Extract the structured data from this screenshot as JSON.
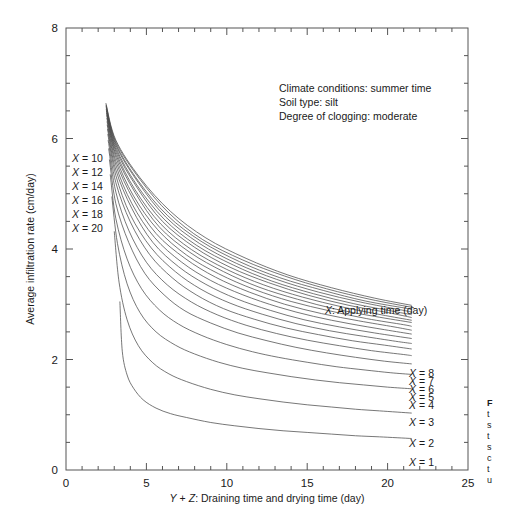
{
  "chart_data": {
    "type": "line",
    "title": "",
    "xlabel": "Y + Z: Draining time and drying time (day)",
    "ylabel": "Average infiltration rate (cm/day)",
    "xlim": [
      0,
      25
    ],
    "ylim": [
      0,
      8
    ],
    "xticks": [
      0,
      5,
      10,
      15,
      20,
      25
    ],
    "yticks": [
      0,
      2,
      4,
      6,
      8
    ],
    "xtick_labels": [
      "0",
      "5",
      "10",
      "15",
      "20",
      "25"
    ],
    "ytick_labels": [
      "0",
      "2",
      "4",
      "6",
      "8"
    ],
    "x_minor_step": 1,
    "y_minor_step": 0.5,
    "grid": false,
    "legend_position": "inside-right",
    "legend_note": "X: Applying time (day)",
    "annotations": [
      "Climate conditions: summer time",
      "Soil type: silt",
      "Degree of clogging: moderate"
    ],
    "series_variable": "X",
    "series": [
      {
        "name": "X = 1",
        "x": [
          3.35,
          3.5,
          3.8,
          4.2,
          4.8,
          5.6,
          6.5,
          7.5,
          9,
          10.5,
          12,
          13.5,
          15,
          16.5,
          18,
          19.5,
          21.5
        ],
        "values": [
          3.05,
          2.15,
          1.72,
          1.48,
          1.27,
          1.12,
          1.02,
          0.95,
          0.86,
          0.8,
          0.75,
          0.71,
          0.68,
          0.65,
          0.62,
          0.6,
          0.57
        ]
      },
      {
        "name": "X = 2",
        "x": [
          3.0,
          3.3,
          3.8,
          4.5,
          5.4,
          6.4,
          7.5,
          9,
          10.5,
          12,
          13.5,
          15,
          16.5,
          18,
          19.5,
          21.5
        ],
        "values": [
          4.32,
          3.4,
          2.72,
          2.25,
          1.94,
          1.74,
          1.6,
          1.46,
          1.36,
          1.29,
          1.23,
          1.18,
          1.14,
          1.1,
          1.07,
          1.03
        ]
      },
      {
        "name": "X = 3",
        "x": [
          2.85,
          3.2,
          3.8,
          4.6,
          5.6,
          6.8,
          8,
          9.5,
          11,
          12.5,
          14,
          15.5,
          17,
          18.5,
          20,
          21.5
        ],
        "values": [
          4.95,
          4.1,
          3.37,
          2.85,
          2.5,
          2.26,
          2.1,
          1.95,
          1.84,
          1.76,
          1.69,
          1.63,
          1.58,
          1.54,
          1.5,
          1.47
        ]
      },
      {
        "name": "X = 4",
        "x": [
          2.75,
          3.1,
          3.8,
          4.7,
          5.8,
          7,
          8.4,
          10,
          11.6,
          13.2,
          15,
          16.8,
          18.6,
          20.2,
          21.5
        ],
        "values": [
          5.35,
          4.55,
          3.82,
          3.28,
          2.9,
          2.64,
          2.44,
          2.27,
          2.14,
          2.04,
          1.95,
          1.87,
          1.81,
          1.76,
          1.73
        ]
      },
      {
        "name": "X = 5",
        "x": [
          2.7,
          3.1,
          3.9,
          4.9,
          6.1,
          7.4,
          9,
          10.7,
          12.5,
          14.3,
          16.2,
          18,
          19.8,
          21.5
        ],
        "values": [
          5.62,
          4.82,
          4.12,
          3.56,
          3.17,
          2.88,
          2.66,
          2.48,
          2.34,
          2.22,
          2.12,
          2.04,
          1.97,
          1.92
        ]
      },
      {
        "name": "X = 6",
        "x": [
          2.65,
          3.1,
          3.9,
          5,
          6.3,
          7.8,
          9.4,
          11.2,
          13.1,
          15,
          17,
          19,
          21,
          21.5
        ],
        "values": [
          5.82,
          5.03,
          4.34,
          3.76,
          3.35,
          3.04,
          2.81,
          2.62,
          2.47,
          2.35,
          2.25,
          2.16,
          2.09,
          2.07
        ]
      },
      {
        "name": "X = 7",
        "x": [
          2.62,
          3.1,
          4,
          5.2,
          6.6,
          8.1,
          9.8,
          11.7,
          13.7,
          15.7,
          17.8,
          19.8,
          21.5
        ],
        "values": [
          5.97,
          5.2,
          4.49,
          3.9,
          3.48,
          3.17,
          2.92,
          2.73,
          2.57,
          2.45,
          2.34,
          2.26,
          2.19
        ]
      },
      {
        "name": "X = 8",
        "x": [
          2.6,
          3.1,
          4,
          5.3,
          6.8,
          8.4,
          10.2,
          12.2,
          14.3,
          16.4,
          18.5,
          20.5,
          21.5
        ],
        "values": [
          6.08,
          5.33,
          4.62,
          4.02,
          3.59,
          3.27,
          3.02,
          2.82,
          2.65,
          2.52,
          2.42,
          2.33,
          2.29
        ]
      },
      {
        "name": "X = 9",
        "x": [
          2.58,
          3.1,
          4.1,
          5.4,
          7,
          8.7,
          10.6,
          12.7,
          14.8,
          17,
          19.2,
          21.5
        ],
        "values": [
          6.17,
          5.43,
          4.73,
          4.12,
          3.68,
          3.36,
          3.1,
          2.89,
          2.72,
          2.59,
          2.48,
          2.38
        ]
      },
      {
        "name": "X = 10",
        "x": [
          2.56,
          3.1,
          4.1,
          5.5,
          7.2,
          9,
          11,
          13.2,
          15.4,
          17.6,
          19.8,
          21.5
        ],
        "values": [
          6.25,
          5.52,
          4.82,
          4.21,
          3.76,
          3.43,
          3.17,
          2.95,
          2.78,
          2.65,
          2.54,
          2.46
        ]
      },
      {
        "name": "X = 11",
        "x": [
          2.55,
          3.1,
          4.2,
          5.6,
          7.4,
          9.3,
          11.4,
          13.6,
          15.9,
          18.2,
          20.4,
          21.5
        ],
        "values": [
          6.31,
          5.59,
          4.89,
          4.28,
          3.83,
          3.49,
          3.22,
          3.0,
          2.83,
          2.7,
          2.59,
          2.53
        ]
      },
      {
        "name": "X = 12",
        "x": [
          2.54,
          3.1,
          4.2,
          5.7,
          7.5,
          9.5,
          11.7,
          14,
          16.4,
          18.7,
          21,
          21.5
        ],
        "values": [
          6.37,
          5.66,
          4.96,
          4.35,
          3.89,
          3.55,
          3.27,
          3.05,
          2.88,
          2.74,
          2.63,
          2.6
        ]
      },
      {
        "name": "X = 13",
        "x": [
          2.53,
          3.1,
          4.3,
          5.8,
          7.7,
          9.8,
          12,
          14.4,
          16.8,
          19.2,
          21.5
        ],
        "values": [
          6.42,
          5.71,
          5.02,
          4.4,
          3.94,
          3.59,
          3.31,
          3.09,
          2.91,
          2.78,
          2.67
        ]
      },
      {
        "name": "X = 14",
        "x": [
          2.52,
          3.1,
          4.3,
          5.9,
          7.8,
          10,
          12.3,
          14.7,
          17.2,
          19.6,
          21.5
        ],
        "values": [
          6.46,
          5.76,
          5.07,
          4.45,
          3.99,
          3.63,
          3.35,
          3.13,
          2.95,
          2.81,
          2.71
        ]
      },
      {
        "name": "X = 15",
        "x": [
          2.51,
          3.1,
          4.4,
          6,
          8,
          10.2,
          12.6,
          15.1,
          17.6,
          20,
          21.5
        ],
        "values": [
          6.5,
          5.8,
          5.12,
          4.5,
          4.03,
          3.67,
          3.39,
          3.16,
          2.98,
          2.85,
          2.76
        ]
      },
      {
        "name": "X = 16",
        "x": [
          2.5,
          3.1,
          4.4,
          6.1,
          8.1,
          10.4,
          12.8,
          15.4,
          17.9,
          20.4,
          21.5
        ],
        "values": [
          6.53,
          5.84,
          5.16,
          4.54,
          4.07,
          3.71,
          3.42,
          3.19,
          3.01,
          2.87,
          2.81
        ]
      },
      {
        "name": "X = 17",
        "x": [
          2.5,
          3.1,
          4.5,
          6.2,
          8.3,
          10.6,
          13.1,
          15.7,
          18.3,
          20.8,
          21.5
        ],
        "values": [
          6.56,
          5.88,
          5.2,
          4.58,
          4.1,
          3.74,
          3.45,
          3.22,
          3.04,
          2.9,
          2.86
        ]
      },
      {
        "name": "X = 18",
        "x": [
          2.49,
          3.1,
          4.5,
          6.3,
          8.4,
          10.8,
          13.3,
          16,
          18.6,
          21.1,
          21.5
        ],
        "values": [
          6.59,
          5.91,
          5.23,
          4.61,
          4.14,
          3.77,
          3.48,
          3.25,
          3.06,
          2.93,
          2.91
        ]
      },
      {
        "name": "X = 19",
        "x": [
          2.49,
          3.1,
          4.6,
          6.4,
          8.5,
          11,
          13.6,
          16.2,
          18.9,
          21.4,
          21.5
        ],
        "values": [
          6.61,
          5.94,
          5.26,
          4.65,
          4.17,
          3.8,
          3.51,
          3.28,
          3.09,
          2.95,
          2.95
        ]
      },
      {
        "name": "X = 20",
        "x": [
          2.48,
          3.1,
          4.6,
          6.5,
          8.7,
          11.2,
          13.8,
          16.5,
          19.2,
          21.5
        ],
        "values": [
          6.64,
          5.97,
          5.29,
          4.68,
          4.2,
          3.83,
          3.53,
          3.3,
          3.11,
          2.98
        ]
      }
    ],
    "left_labels": [
      {
        "text": "X = 10",
        "value": 10
      },
      {
        "text": "X = 12",
        "value": 12
      },
      {
        "text": "X = 14",
        "value": 14
      },
      {
        "text": "X = 16",
        "value": 16
      },
      {
        "text": "X = 18",
        "value": 18
      },
      {
        "text": "X = 20",
        "value": 20
      }
    ],
    "right_labels": [
      {
        "text": "X = 8",
        "value": 8
      },
      {
        "text": "X = 7",
        "value": 7
      },
      {
        "text": "X = 6",
        "value": 6
      },
      {
        "text": "X = 5",
        "value": 5
      },
      {
        "text": "X = 4",
        "value": 4
      },
      {
        "text": "X = 3",
        "value": 3
      },
      {
        "text": "X = 2",
        "value": 2
      },
      {
        "text": "X = 1",
        "value": 1
      }
    ]
  },
  "labels": {
    "x_axis_prefix_y": "Y",
    "x_axis_plus": "+",
    "x_axis_prefix_z": "Z",
    "x_axis_rest": ": Draining time and drying time (day)",
    "y_axis": "Average infiltration rate (cm/day)",
    "legend_var": "X",
    "legend_rest": ": Applying time (day)",
    "var_x": "X",
    "eq": "="
  },
  "caption_fragment": {
    "lines": [
      "F",
      "t",
      "s",
      "t",
      "s",
      "c",
      "t",
      "u"
    ]
  },
  "colors": {
    "background": "#ffffff",
    "curve": "#4a4a4a",
    "axis": "#555555",
    "text": "#1a1a1a"
  }
}
